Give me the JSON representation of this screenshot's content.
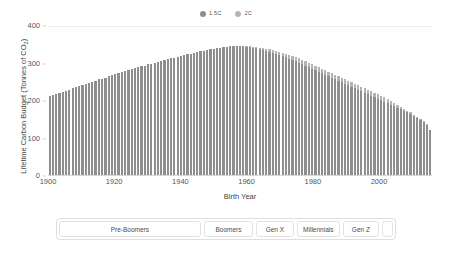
{
  "chart_data": {
    "type": "bar",
    "title": "",
    "xlabel": "Birth Year",
    "ylabel": "Lifetime Carbon Budget (Tonnes of CO2)",
    "ylabel_prefix": "Lifetime Carbon Budget (Tonnes of CO",
    "ylabel_sub": "2",
    "ylabel_suffix": ")",
    "xlim": [
      1900,
      2016
    ],
    "ylim": [
      0,
      400
    ],
    "grid": true,
    "legend_position": "top-center",
    "xticks": [
      "1900",
      "1920",
      "1940",
      "1960",
      "1980",
      "2000"
    ],
    "xtick_values": [
      1900,
      1920,
      1940,
      1960,
      1980,
      2000
    ],
    "yticks": [
      "0",
      "100",
      "200",
      "300",
      "400"
    ],
    "ytick_values": [
      0,
      100,
      200,
      300,
      400
    ],
    "colors": {
      "series_15c": "#8e8e8e",
      "series_2c": "#b4b4b4"
    },
    "x": [
      1900,
      1901,
      1902,
      1903,
      1904,
      1905,
      1906,
      1907,
      1908,
      1909,
      1910,
      1911,
      1912,
      1913,
      1914,
      1915,
      1916,
      1917,
      1918,
      1919,
      1920,
      1921,
      1922,
      1923,
      1924,
      1925,
      1926,
      1927,
      1928,
      1929,
      1930,
      1931,
      1932,
      1933,
      1934,
      1935,
      1936,
      1937,
      1938,
      1939,
      1940,
      1941,
      1942,
      1943,
      1944,
      1945,
      1946,
      1947,
      1948,
      1949,
      1950,
      1951,
      1952,
      1953,
      1954,
      1955,
      1956,
      1957,
      1958,
      1959,
      1960,
      1961,
      1962,
      1963,
      1964,
      1965,
      1966,
      1967,
      1968,
      1969,
      1970,
      1971,
      1972,
      1973,
      1974,
      1975,
      1976,
      1977,
      1978,
      1979,
      1980,
      1981,
      1982,
      1983,
      1984,
      1985,
      1986,
      1987,
      1988,
      1989,
      1990,
      1991,
      1992,
      1993,
      1994,
      1995,
      1996,
      1997,
      1998,
      1999,
      2000,
      2001,
      2002,
      2003,
      2004,
      2005,
      2006,
      2007,
      2008,
      2009,
      2010,
      2011,
      2012,
      2013,
      2014,
      2015,
      2016
    ],
    "series": [
      {
        "name": "1.5C",
        "color": "#8e8e8e",
        "values": [
          210,
          213,
          216,
          219,
          222,
          225,
          228,
          231,
          234,
          237,
          240,
          243,
          246,
          249,
          252,
          255,
          257,
          260,
          263,
          266,
          269,
          271,
          274,
          277,
          279,
          282,
          285,
          287,
          290,
          292,
          295,
          297,
          299,
          302,
          304,
          306,
          309,
          311,
          313,
          315,
          317,
          320,
          322,
          324,
          326,
          328,
          330,
          332,
          334,
          335,
          337,
          339,
          340,
          341,
          342,
          343,
          343,
          343,
          343,
          343,
          342,
          341,
          340,
          338,
          336,
          334,
          331,
          329,
          326,
          323,
          320,
          317,
          314,
          310,
          307,
          303,
          299,
          295,
          291,
          287,
          283,
          279,
          275,
          271,
          267,
          263,
          259,
          255,
          251,
          247,
          243,
          239,
          235,
          231,
          227,
          223,
          219,
          215,
          211,
          207,
          203,
          199,
          195,
          191,
          187,
          183,
          179,
          175,
          171,
          167,
          163,
          158,
          153,
          148,
          142,
          134,
          120
        ]
      },
      {
        "name": "2C",
        "color": "#b4b4b4",
        "values": [
          210,
          213,
          216,
          219,
          222,
          225,
          228,
          231,
          234,
          237,
          240,
          243,
          246,
          249,
          252,
          255,
          257,
          260,
          263,
          266,
          269,
          271,
          274,
          277,
          279,
          282,
          285,
          287,
          290,
          292,
          295,
          297,
          299,
          302,
          304,
          306,
          309,
          311,
          313,
          315,
          317,
          320,
          322,
          324,
          326,
          328,
          330,
          332,
          334,
          335,
          337,
          339,
          340,
          341,
          342,
          343,
          344,
          344,
          344,
          344,
          344,
          343,
          342,
          341,
          340,
          338,
          337,
          335,
          333,
          331,
          329,
          326,
          324,
          321,
          318,
          315,
          311,
          308,
          304,
          300,
          296,
          292,
          288,
          284,
          280,
          276,
          272,
          268,
          264,
          260,
          256,
          252,
          248,
          244,
          240,
          236,
          232,
          228,
          224,
          220,
          216,
          211,
          207,
          202,
          197,
          192,
          187,
          182,
          177,
          172,
          167,
          161,
          155,
          149,
          143,
          135,
          121
        ]
      }
    ]
  },
  "legend": {
    "items": [
      {
        "label": "1.5C",
        "color": "#8e8e8e"
      },
      {
        "label": "2C",
        "color": "#b4b4b4"
      }
    ]
  },
  "generations": {
    "segments": [
      {
        "label": "Pre-Boomers",
        "weight": 45.5
      },
      {
        "label": "Boomers",
        "weight": 15.5
      },
      {
        "label": "Gen X",
        "weight": 11.5
      },
      {
        "label": "Millennials",
        "weight": 13.5
      },
      {
        "label": "Gen Z",
        "weight": 11.0
      },
      {
        "label": "",
        "weight": 3.0
      }
    ]
  }
}
